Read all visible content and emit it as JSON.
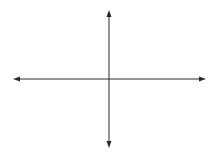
{
  "diagram": {
    "type": "coordinate-axes",
    "colors": {
      "background": "#ffffff",
      "axis": "#2a2a2a"
    },
    "x_axis": {
      "x1": 13,
      "x2": 206,
      "y": 79,
      "arrows": "both"
    },
    "y_axis": {
      "x": 109,
      "y1": 10,
      "y2": 148,
      "arrows": "both"
    },
    "labels": []
  }
}
